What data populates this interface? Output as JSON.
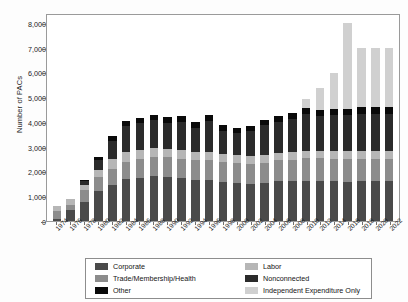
{
  "chart_data": {
    "type": "bar",
    "stacked": true,
    "title": "",
    "xlabel": "",
    "ylabel": "Number of PACs",
    "ylim": [
      0,
      8400
    ],
    "yticks": [
      0,
      1000,
      2000,
      3000,
      4000,
      5000,
      6000,
      7000,
      8000
    ],
    "ytick_labels": [
      "0",
      "1,000",
      "2,000",
      "3,000",
      "4,000",
      "5,000",
      "6,000",
      "7,000",
      "8,000"
    ],
    "grid": false,
    "legend_position": "bottom",
    "categories": [
      "1974",
      "1976",
      "1978",
      "1980",
      "1982",
      "1984",
      "1986",
      "1988",
      "1990",
      "1992",
      "1994",
      "1996",
      "1998",
      "2000",
      "2002",
      "2004",
      "2006",
      "2008",
      "2010",
      "2012",
      "2014",
      "2016",
      "2018",
      "2020",
      "2022"
    ],
    "series": [
      {
        "name": "Corporate",
        "color": "#4a4a4a",
        "values": [
          89,
          433,
          785,
          1204,
          1469,
          1682,
          1744,
          1816,
          1795,
          1735,
          1660,
          1642,
          1567,
          1523,
          1497,
          1538,
          1598,
          1598,
          1618,
          1608,
          1603,
          1595,
          1600,
          1600,
          1600
        ]
      },
      {
        "name": "Trade/Membership/Health",
        "color": "#8c8c8c",
        "values": [
          318,
          224,
          453,
          574,
          649,
          698,
          745,
          786,
          774,
          770,
          792,
          825,
          821,
          812,
          805,
          815,
          860,
          880,
          915,
          917,
          920,
          920,
          920,
          920,
          920
        ]
      },
      {
        "name": "Labor",
        "color": "#b6b6b6",
        "values": [
          201,
          224,
          217,
          297,
          380,
          394,
          384,
          354,
          346,
          347,
          333,
          332,
          321,
          316,
          308,
          303,
          304,
          301,
          302,
          301,
          300,
          300,
          300,
          300,
          300
        ]
      },
      {
        "name": "Nonconnected",
        "color": "#2b2b2b",
        "values": [
          0,
          0,
          165,
          374,
          723,
          1053,
          1077,
          1115,
          1062,
          1145,
          980,
          1259,
          935,
          902,
          1018,
          1225,
          1255,
          1328,
          1487,
          1415,
          1470,
          1480,
          1520,
          1520,
          1520
        ]
      },
      {
        "name": "Other",
        "color": "#0a0a0a",
        "values": [
          0,
          0,
          30,
          150,
          209,
          220,
          220,
          230,
          230,
          238,
          235,
          240,
          220,
          210,
          212,
          215,
          230,
          240,
          250,
          250,
          250,
          250,
          250,
          250,
          250
        ]
      },
      {
        "name": "Independent Expenditure Only",
        "color": "#d0d0d0",
        "values": [
          0,
          0,
          0,
          0,
          0,
          0,
          0,
          0,
          0,
          0,
          0,
          0,
          0,
          0,
          0,
          0,
          0,
          0,
          350,
          900,
          1440,
          3450,
          2400,
          2400,
          2400
        ]
      }
    ]
  },
  "legend": {
    "entries": [
      {
        "label": "Corporate",
        "color": "#4a4a4a"
      },
      {
        "label": "Trade/Membership/Health",
        "color": "#8c8c8c"
      },
      {
        "label": "Other",
        "color": "#0a0a0a"
      },
      {
        "label": "Labor",
        "color": "#b6b6b6"
      },
      {
        "label": "Nonconnected",
        "color": "#2b2b2b"
      },
      {
        "label": "Independent Expenditure Only",
        "color": "#d0d0d0"
      }
    ]
  }
}
